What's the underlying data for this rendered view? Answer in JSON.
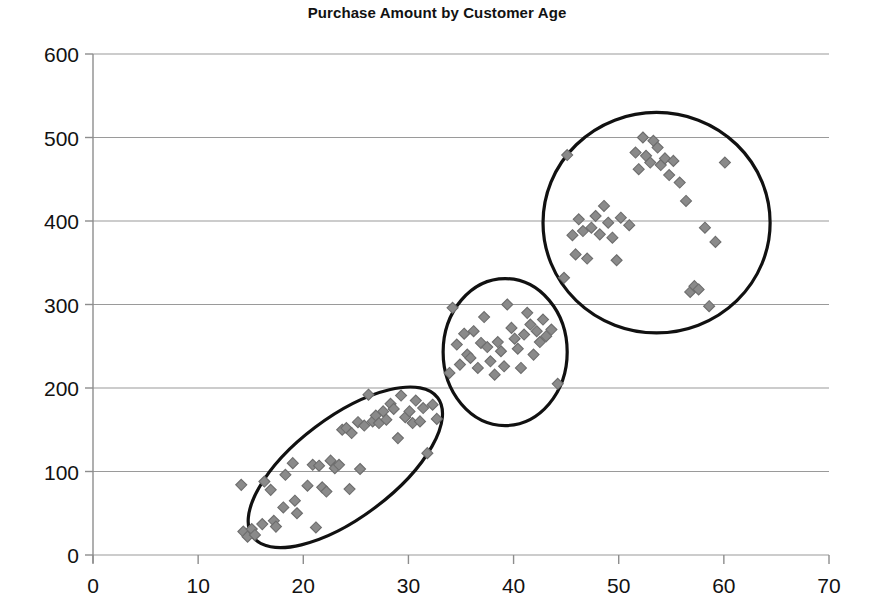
{
  "chart_data": {
    "type": "scatter",
    "title": "Purchase Amount by Customer Age",
    "xlabel": "",
    "ylabel": "",
    "xlim": [
      0,
      70
    ],
    "ylim": [
      0,
      600
    ],
    "xticks": [
      0,
      10,
      20,
      30,
      40,
      50,
      60,
      70
    ],
    "yticks": [
      0,
      100,
      200,
      300,
      400,
      500,
      600
    ],
    "grid": "horizontal",
    "legend": "none",
    "marker": {
      "shape": "diamond",
      "fill_color": "#8a8a8a",
      "edge_color": "#6d6d6d",
      "size_px": 11
    },
    "annotations": [
      {
        "name": "cluster-1-outline",
        "shape": "ellipse",
        "cx": 24.0,
        "cy": 105,
        "rx": 11.0,
        "ry": 60,
        "rotation_deg": -37,
        "stroke_color": "#111111"
      },
      {
        "name": "cluster-2-outline",
        "shape": "ellipse",
        "cx": 39.2,
        "cy": 243,
        "rx": 5.9,
        "ry": 88,
        "rotation_deg": 0,
        "stroke_color": "#111111"
      },
      {
        "name": "cluster-3-outline",
        "shape": "ellipse",
        "cx": 53.6,
        "cy": 398,
        "rx": 10.8,
        "ry": 132,
        "rotation_deg": 0,
        "stroke_color": "#111111"
      }
    ],
    "series": [
      {
        "name": "cluster-1",
        "points": [
          [
            14.1,
            84
          ],
          [
            14.3,
            28
          ],
          [
            14.7,
            22
          ],
          [
            15.1,
            31
          ],
          [
            15.4,
            24
          ],
          [
            16.1,
            37
          ],
          [
            16.3,
            88
          ],
          [
            16.9,
            78
          ],
          [
            17.2,
            41
          ],
          [
            17.4,
            34
          ],
          [
            18.1,
            57
          ],
          [
            18.3,
            96
          ],
          [
            19.0,
            110
          ],
          [
            19.2,
            65
          ],
          [
            19.4,
            50
          ],
          [
            20.4,
            83
          ],
          [
            20.9,
            108
          ],
          [
            21.2,
            33
          ],
          [
            21.5,
            107
          ],
          [
            21.8,
            81
          ],
          [
            22.2,
            76
          ],
          [
            22.6,
            113
          ],
          [
            23.0,
            104
          ],
          [
            23.4,
            108
          ],
          [
            23.7,
            150
          ],
          [
            24.1,
            152
          ],
          [
            24.4,
            79
          ],
          [
            24.6,
            146
          ],
          [
            25.2,
            159
          ],
          [
            25.4,
            103
          ],
          [
            25.8,
            155
          ],
          [
            26.2,
            192
          ],
          [
            26.6,
            160
          ],
          [
            26.9,
            167
          ],
          [
            27.2,
            158
          ],
          [
            27.6,
            172
          ],
          [
            27.9,
            162
          ],
          [
            28.3,
            181
          ],
          [
            28.6,
            175
          ],
          [
            29.0,
            140
          ],
          [
            29.3,
            191
          ],
          [
            29.7,
            165
          ],
          [
            30.1,
            172
          ],
          [
            30.4,
            158
          ],
          [
            30.7,
            185
          ],
          [
            31.1,
            160
          ],
          [
            31.4,
            176
          ],
          [
            31.8,
            122
          ],
          [
            32.3,
            180
          ],
          [
            32.7,
            163
          ]
        ]
      },
      {
        "name": "cluster-2",
        "points": [
          [
            33.9,
            218
          ],
          [
            34.2,
            296
          ],
          [
            34.6,
            252
          ],
          [
            34.9,
            228
          ],
          [
            35.3,
            265
          ],
          [
            35.6,
            240
          ],
          [
            35.9,
            236
          ],
          [
            36.2,
            268
          ],
          [
            36.6,
            224
          ],
          [
            36.9,
            254
          ],
          [
            37.2,
            285
          ],
          [
            37.5,
            249
          ],
          [
            37.8,
            232
          ],
          [
            38.2,
            216
          ],
          [
            38.5,
            255
          ],
          [
            38.8,
            244
          ],
          [
            39.1,
            226
          ],
          [
            39.4,
            300
          ],
          [
            39.8,
            272
          ],
          [
            40.1,
            259
          ],
          [
            40.4,
            247
          ],
          [
            40.7,
            224
          ],
          [
            41.0,
            264
          ],
          [
            41.3,
            290
          ],
          [
            41.6,
            276
          ],
          [
            41.9,
            240
          ],
          [
            42.2,
            268
          ],
          [
            42.5,
            255
          ],
          [
            42.8,
            282
          ],
          [
            43.1,
            262
          ],
          [
            43.6,
            270
          ],
          [
            44.2,
            205
          ]
        ]
      },
      {
        "name": "cluster-3",
        "points": [
          [
            44.8,
            332
          ],
          [
            45.1,
            479
          ],
          [
            45.6,
            383
          ],
          [
            45.9,
            360
          ],
          [
            46.2,
            402
          ],
          [
            46.6,
            388
          ],
          [
            47.0,
            355
          ],
          [
            47.4,
            392
          ],
          [
            47.8,
            406
          ],
          [
            48.2,
            384
          ],
          [
            48.6,
            418
          ],
          [
            49.0,
            398
          ],
          [
            49.4,
            380
          ],
          [
            49.8,
            353
          ],
          [
            50.2,
            404
          ],
          [
            51.0,
            395
          ],
          [
            51.6,
            482
          ],
          [
            51.9,
            462
          ],
          [
            52.3,
            500
          ],
          [
            52.6,
            478
          ],
          [
            53.0,
            470
          ],
          [
            53.3,
            496
          ],
          [
            53.7,
            488
          ],
          [
            54.0,
            467
          ],
          [
            54.4,
            475
          ],
          [
            54.8,
            455
          ],
          [
            55.2,
            472
          ],
          [
            55.8,
            446
          ],
          [
            56.4,
            424
          ],
          [
            56.8,
            315
          ],
          [
            57.2,
            322
          ],
          [
            57.6,
            318
          ],
          [
            58.2,
            392
          ],
          [
            58.6,
            298
          ],
          [
            59.2,
            375
          ],
          [
            60.1,
            470
          ]
        ]
      }
    ]
  }
}
